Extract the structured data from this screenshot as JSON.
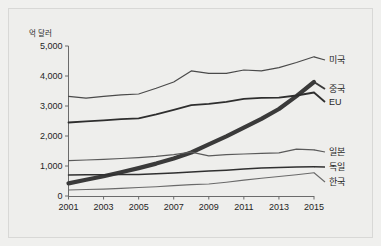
{
  "chart_data": {
    "type": "line",
    "title": "",
    "subtitle": "",
    "xlabel": "",
    "ylabel": "억 달러",
    "unit_label": "억 달러",
    "x": [
      2001,
      2002,
      2003,
      2004,
      2005,
      2006,
      2007,
      2008,
      2009,
      2010,
      2011,
      2012,
      2013,
      2014,
      2015
    ],
    "xtick_labels": [
      "2001",
      "2003",
      "2005",
      "2007",
      "2009",
      "2011",
      "2013",
      "2015"
    ],
    "xticks": [
      2001,
      2003,
      2005,
      2007,
      2009,
      2011,
      2013,
      2015
    ],
    "ytick_labels": [
      "0",
      "1,000",
      "2,000",
      "3,000",
      "4,000",
      "5,000"
    ],
    "yticks": [
      0,
      1000,
      2000,
      3000,
      4000,
      5000
    ],
    "xlim": [
      2001,
      2015
    ],
    "ylim": [
      0,
      5000
    ],
    "grid": false,
    "legend_position": "right-inline-labels",
    "series": [
      {
        "name": "미국",
        "label": "미국",
        "color": "#4a4a4a",
        "width": 1.2,
        "values": [
          3320,
          3260,
          3320,
          3370,
          3400,
          3590,
          3800,
          4170,
          4090,
          4090,
          4200,
          4170,
          4280,
          4450,
          4640
        ]
      },
      {
        "name": "중국",
        "label": "중국",
        "color": "#3a3a3a",
        "width": 4.2,
        "values": [
          420,
          540,
          660,
          790,
          930,
          1080,
          1250,
          1450,
          1720,
          1990,
          2280,
          2570,
          2900,
          3330,
          3800
        ]
      },
      {
        "name": "EU",
        "label": "EU",
        "color": "#2e2e2e",
        "width": 1.8,
        "values": [
          2450,
          2490,
          2520,
          2560,
          2590,
          2720,
          2870,
          3030,
          3070,
          3140,
          3240,
          3270,
          3280,
          3350,
          3450
        ]
      },
      {
        "name": "일본",
        "label": "일본",
        "color": "#5a5a5a",
        "width": 1.2,
        "values": [
          1180,
          1200,
          1220,
          1250,
          1280,
          1320,
          1380,
          1460,
          1340,
          1380,
          1400,
          1420,
          1440,
          1560,
          1540
        ]
      },
      {
        "name": "독일",
        "label": "독일",
        "color": "#303030",
        "width": 1.5,
        "values": [
          700,
          705,
          710,
          715,
          720,
          740,
          770,
          800,
          830,
          860,
          900,
          930,
          950,
          965,
          975
        ]
      },
      {
        "name": "한국",
        "label": "한국",
        "color": "#6a6a6a",
        "width": 1.1,
        "values": [
          200,
          215,
          230,
          255,
          285,
          310,
          345,
          380,
          400,
          460,
          530,
          590,
          650,
          710,
          775
        ]
      }
    ],
    "series_labels": [
      {
        "name": "미국",
        "y_value": 4640
      },
      {
        "name": "중국",
        "y_value": 3800
      },
      {
        "name": "EU",
        "y_value": 3450
      },
      {
        "name": "일본",
        "y_value": 1540
      },
      {
        "name": "독일",
        "y_value": 975
      },
      {
        "name": "한국",
        "y_value": 775
      }
    ]
  }
}
